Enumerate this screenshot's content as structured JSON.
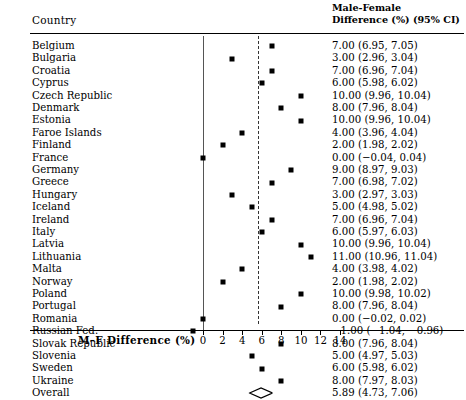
{
  "header": {
    "country_label": "Country",
    "right_line1": "Male-Female",
    "right_line2": "Difference (%) (95% CI)"
  },
  "axis": {
    "title": "M–F Difference (%)",
    "ticks": [
      0,
      2,
      4,
      6,
      8,
      10,
      12,
      14
    ],
    "tick_labels": [
      "0",
      "2",
      "4",
      "6",
      "8",
      "10",
      "12",
      "14"
    ],
    "xmin": -2.2,
    "xmax": 14.9
  },
  "reference_lines": {
    "null_value": 0,
    "pooled_value": 5.89
  },
  "colors": {
    "marker": "#000000",
    "null_line": "#555555",
    "pooled_line": "#333333",
    "background": "#ffffff",
    "text": "#000000"
  },
  "chart_data": {
    "type": "forest",
    "title": "",
    "xlabel": "M–F Difference (%)",
    "ylabel": "Country",
    "xlim": [
      -2.2,
      14.9
    ],
    "grid": false,
    "legend": "none",
    "effect_label": "Male-Female Difference (%) (95% CI)",
    "categories": [
      "Belgium",
      "Bulgaria",
      "Croatia",
      "Cyprus",
      "Czech Republic",
      "Denmark",
      "Estonia",
      "Faroe Islands",
      "Finland",
      "France",
      "Germany",
      "Greece",
      "Hungary",
      "Iceland",
      "Ireland",
      "Italy",
      "Latvia",
      "Lithuania",
      "Malta",
      "Norway",
      "Poland",
      "Portugal",
      "Romania",
      "Russian Fed.",
      "Slovak Republic",
      "Slovenia",
      "Sweden",
      "Ukraine",
      "Overall"
    ],
    "rows": [
      {
        "label": "Belgium",
        "estimate": 7.0,
        "ci_low": 6.95,
        "ci_high": 7.05,
        "text": "7.00 (6.95, 7.05)",
        "summary": false
      },
      {
        "label": "Bulgaria",
        "estimate": 3.0,
        "ci_low": 2.96,
        "ci_high": 3.04,
        "text": "3.00 (2.96, 3.04)",
        "summary": false
      },
      {
        "label": "Croatia",
        "estimate": 7.0,
        "ci_low": 6.96,
        "ci_high": 7.04,
        "text": "7.00 (6.96, 7.04)",
        "summary": false
      },
      {
        "label": "Cyprus",
        "estimate": 6.0,
        "ci_low": 5.98,
        "ci_high": 6.02,
        "text": "6.00 (5.98, 6.02)",
        "summary": false
      },
      {
        "label": "Czech Republic",
        "estimate": 10.0,
        "ci_low": 9.96,
        "ci_high": 10.04,
        "text": "10.00 (9.96, 10.04)",
        "summary": false
      },
      {
        "label": "Denmark",
        "estimate": 8.0,
        "ci_low": 7.96,
        "ci_high": 8.04,
        "text": "8.00 (7.96, 8.04)",
        "summary": false
      },
      {
        "label": "Estonia",
        "estimate": 10.0,
        "ci_low": 9.96,
        "ci_high": 10.04,
        "text": "10.00 (9.96, 10.04)",
        "summary": false
      },
      {
        "label": "Faroe Islands",
        "estimate": 4.0,
        "ci_low": 3.96,
        "ci_high": 4.04,
        "text": "4.00 (3.96, 4.04)",
        "summary": false
      },
      {
        "label": "Finland",
        "estimate": 2.0,
        "ci_low": 1.98,
        "ci_high": 2.02,
        "text": "2.00 (1.98, 2.02)",
        "summary": false
      },
      {
        "label": "France",
        "estimate": 0.0,
        "ci_low": -0.04,
        "ci_high": 0.04,
        "text": "0.00 (−0.04, 0.04)",
        "summary": false
      },
      {
        "label": "Germany",
        "estimate": 9.0,
        "ci_low": 8.97,
        "ci_high": 9.03,
        "text": "9.00 (8.97, 9.03)",
        "summary": false
      },
      {
        "label": "Greece",
        "estimate": 7.0,
        "ci_low": 6.98,
        "ci_high": 7.02,
        "text": "7.00 (6.98, 7.02)",
        "summary": false
      },
      {
        "label": "Hungary",
        "estimate": 3.0,
        "ci_low": 2.97,
        "ci_high": 3.03,
        "text": "3.00 (2.97, 3.03)",
        "summary": false
      },
      {
        "label": "Iceland",
        "estimate": 5.0,
        "ci_low": 4.98,
        "ci_high": 5.02,
        "text": "5.00 (4.98, 5.02)",
        "summary": false
      },
      {
        "label": "Ireland",
        "estimate": 7.0,
        "ci_low": 6.96,
        "ci_high": 7.04,
        "text": "7.00 (6.96, 7.04)",
        "summary": false
      },
      {
        "label": "Italy",
        "estimate": 6.0,
        "ci_low": 5.97,
        "ci_high": 6.03,
        "text": "6.00 (5.97, 6.03)",
        "summary": false
      },
      {
        "label": "Latvia",
        "estimate": 10.0,
        "ci_low": 9.96,
        "ci_high": 10.04,
        "text": "10.00 (9.96, 10.04)",
        "summary": false
      },
      {
        "label": "Lithuania",
        "estimate": 11.0,
        "ci_low": 10.96,
        "ci_high": 11.04,
        "text": "11.00 (10.96, 11.04)",
        "summary": false
      },
      {
        "label": "Malta",
        "estimate": 4.0,
        "ci_low": 3.98,
        "ci_high": 4.02,
        "text": "4.00 (3.98, 4.02)",
        "summary": false
      },
      {
        "label": "Norway",
        "estimate": 2.0,
        "ci_low": 1.98,
        "ci_high": 2.02,
        "text": "2.00 (1.98, 2.02)",
        "summary": false
      },
      {
        "label": "Poland",
        "estimate": 10.0,
        "ci_low": 9.98,
        "ci_high": 10.02,
        "text": "10.00 (9.98, 10.02)",
        "summary": false
      },
      {
        "label": "Portugal",
        "estimate": 8.0,
        "ci_low": 7.96,
        "ci_high": 8.04,
        "text": "8.00 (7.96, 8.04)",
        "summary": false
      },
      {
        "label": "Romania",
        "estimate": 0.0,
        "ci_low": -0.02,
        "ci_high": 0.02,
        "text": "0.00 (−0.02, 0.02)",
        "summary": false
      },
      {
        "label": "Russian Fed.",
        "estimate": -1.0,
        "ci_low": -1.04,
        "ci_high": -0.96,
        "text": "−1.00 (−1.04, −0.96)",
        "summary": false
      },
      {
        "label": "Slovak Republic",
        "estimate": 8.0,
        "ci_low": 7.96,
        "ci_high": 8.04,
        "text": "8.00 (7.96, 8.04)",
        "summary": false
      },
      {
        "label": "Slovenia",
        "estimate": 5.0,
        "ci_low": 4.97,
        "ci_high": 5.03,
        "text": "5.00 (4.97, 5.03)",
        "summary": false
      },
      {
        "label": "Sweden",
        "estimate": 6.0,
        "ci_low": 5.98,
        "ci_high": 6.02,
        "text": "6.00 (5.98, 6.02)",
        "summary": false
      },
      {
        "label": "Ukraine",
        "estimate": 8.0,
        "ci_low": 7.97,
        "ci_high": 8.03,
        "text": "8.00 (7.97, 8.03)",
        "summary": false
      },
      {
        "label": "Overall",
        "estimate": 5.89,
        "ci_low": 4.73,
        "ci_high": 7.06,
        "text": "5.89 (4.73, 7.06)",
        "summary": true
      }
    ]
  }
}
